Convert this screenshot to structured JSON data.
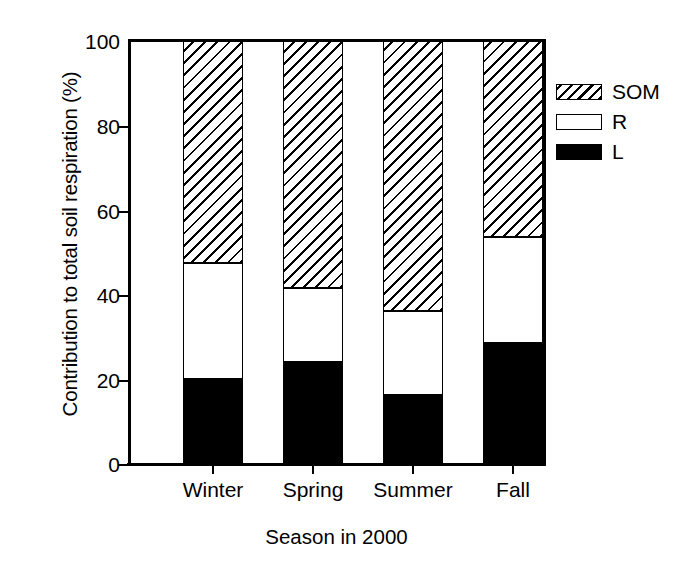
{
  "chart_data": {
    "type": "bar",
    "subtype": "stacked-percentage",
    "title": "",
    "xlabel": "Season in 2000",
    "ylabel": "Contribution to total soil respiration (%)",
    "categories": [
      "Winter",
      "Spring",
      "Summer",
      "Fall"
    ],
    "ylim": [
      0,
      100
    ],
    "yticks": [
      0,
      20,
      40,
      60,
      80,
      100
    ],
    "ytick_labels": [
      "0",
      "20",
      "40",
      "60",
      "80",
      "100"
    ],
    "grid": false,
    "legend_position": "right-top",
    "series": [
      {
        "name": "L",
        "fill": "solid-black",
        "color": "#000000",
        "values": [
          20.1,
          24.1,
          16.3,
          28.6
        ]
      },
      {
        "name": "R",
        "fill": "white",
        "color": "#ffffff",
        "values": [
          27.4,
          17.5,
          19.9,
          25.1
        ]
      },
      {
        "name": "SOM",
        "fill": "diagonal-hatch",
        "color": "#ffffff",
        "values": [
          52.5,
          58.4,
          63.8,
          46.3
        ]
      }
    ],
    "cumulative_tops": {
      "L": [
        20.1,
        24.1,
        16.3,
        28.6
      ],
      "R": [
        47.5,
        41.6,
        36.2,
        53.7
      ],
      "SOM": [
        100,
        100,
        100,
        100
      ]
    }
  },
  "axes": {
    "y_title": "Contribution to total soil respiration (%)",
    "x_title": "Season in 2000",
    "y_ticks": [
      {
        "value": 100,
        "label": "100"
      },
      {
        "value": 80,
        "label": "80"
      },
      {
        "value": 60,
        "label": "60"
      },
      {
        "value": 40,
        "label": "40"
      },
      {
        "value": 20,
        "label": "20"
      },
      {
        "value": 0,
        "label": "0"
      }
    ],
    "x_ticks": [
      {
        "label": "Winter"
      },
      {
        "label": "Spring"
      },
      {
        "label": "Summer"
      },
      {
        "label": "Fall"
      }
    ]
  },
  "legend": {
    "entries": [
      {
        "key": "SOM",
        "label": "SOM",
        "pattern": "diagonal-hatch"
      },
      {
        "key": "R",
        "label": "R",
        "pattern": "white"
      },
      {
        "key": "L",
        "label": "L",
        "pattern": "solid-black"
      }
    ]
  }
}
